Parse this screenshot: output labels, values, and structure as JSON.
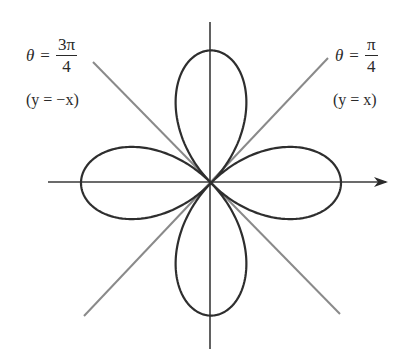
{
  "diagram": {
    "type": "polar-rose",
    "curve": "r = a cos(2θ)",
    "petals": 4,
    "origin": [
      211,
      183
    ],
    "petal_radius_px": 130,
    "colors": {
      "curve": "#2e2e2e",
      "axes": "#3a3a3a",
      "diagonals": "#8a8a8a",
      "text": "#2a2a2a"
    },
    "labels": {
      "left": {
        "theta": "θ",
        "equals": "=",
        "numerator": "3π",
        "denominator": "4",
        "line_eq": "(y = −x)"
      },
      "right": {
        "theta": "θ",
        "equals": "=",
        "numerator": "π",
        "denominator": "4",
        "line_eq": "(y = x)"
      }
    },
    "lines": {
      "horizontal_axis": {
        "from": [
          48,
          182
        ],
        "to": [
          388,
          182
        ],
        "arrow": true
      },
      "vertical_axis": {
        "from": [
          210,
          22
        ],
        "to": [
          210,
          349
        ]
      },
      "diagonal_pi_over_4": {
        "from": [
          84,
          316
        ],
        "to": [
          328,
          58
        ]
      },
      "diagonal_3pi_over_4": {
        "from": [
          93,
          62
        ],
        "to": [
          340,
          314
        ]
      }
    }
  }
}
